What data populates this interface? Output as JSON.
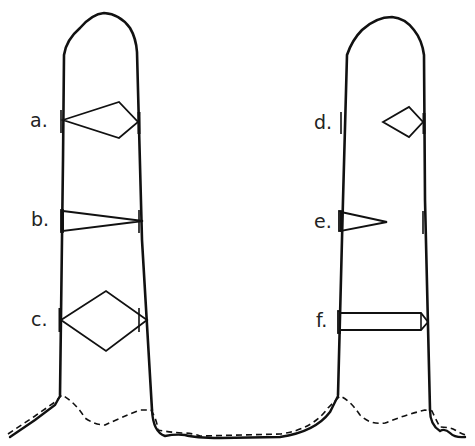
{
  "diagram": {
    "left_column": {
      "labels": [
        {
          "id": "a",
          "text": "a."
        },
        {
          "id": "b",
          "text": "b."
        },
        {
          "id": "c",
          "text": "c."
        }
      ]
    },
    "right_column": {
      "labels": [
        {
          "id": "d",
          "text": "d."
        },
        {
          "id": "e",
          "text": "e."
        },
        {
          "id": "f",
          "text": "f."
        }
      ]
    },
    "colors": {
      "stroke": "#111111",
      "background": "#ffffff"
    }
  }
}
